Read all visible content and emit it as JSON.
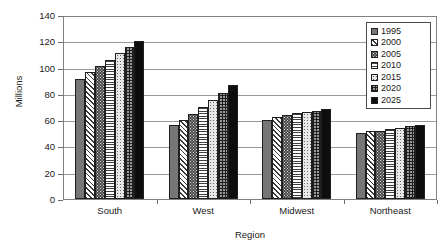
{
  "chart_data": {
    "type": "bar",
    "title": "",
    "xlabel": "Region",
    "ylabel": "Millions",
    "ylim": [
      0,
      140
    ],
    "yticks": [
      0,
      20,
      40,
      60,
      80,
      100,
      120,
      140
    ],
    "grid": true,
    "legend_position": "top-right",
    "categories": [
      "South",
      "West",
      "Midwest",
      "Northeast"
    ],
    "series": [
      {
        "name": "1995",
        "pattern": "solid-gray",
        "color": "#767676",
        "values": [
          92,
          57,
          61,
          51
        ]
      },
      {
        "name": "2000",
        "pattern": "diagonal-hatch",
        "color": "#f2f2f2",
        "values": [
          98,
          61,
          63,
          52
        ]
      },
      {
        "name": "2005",
        "pattern": "dark-speckle",
        "color": "#4a4a4a",
        "values": [
          102.5,
          65.5,
          64.5,
          52.5
        ]
      },
      {
        "name": "2010",
        "pattern": "horizontal-lines",
        "color": "#ffffff",
        "values": [
          107,
          70.5,
          66,
          53.5
        ]
      },
      {
        "name": "2015",
        "pattern": "light-speckle",
        "color": "#e8e8e8",
        "values": [
          112,
          76,
          67,
          54.5
        ]
      },
      {
        "name": "2020",
        "pattern": "cross-grid",
        "color": "#9a9a9a",
        "values": [
          117,
          81.5,
          68,
          56
        ]
      },
      {
        "name": "2025",
        "pattern": "solid-black",
        "color": "#0d0d0d",
        "values": [
          121.5,
          87.5,
          69,
          57
        ]
      }
    ]
  }
}
